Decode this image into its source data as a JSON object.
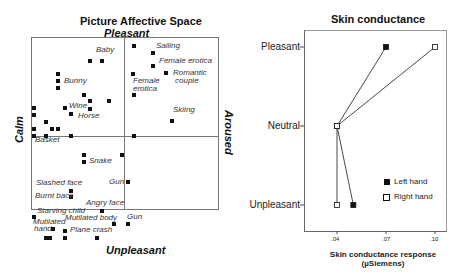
{
  "chart_data": [
    {
      "type": "scatter",
      "title": "Picture Affective Space",
      "axes": {
        "top": "Pleasant",
        "bottom": "Unpleasant",
        "left": "Calm",
        "right": "Aroused"
      },
      "grid": "quadrant lines at center",
      "labels": [
        {
          "text": "Baby",
          "x": 96,
          "y": 50
        },
        {
          "text": "Sailing",
          "x": 156,
          "y": 46
        },
        {
          "text": "Female erotica",
          "x": 159,
          "y": 61
        },
        {
          "text": "Bunny",
          "x": 64,
          "y": 81
        },
        {
          "text": "Romantic",
          "x": 173,
          "y": 73
        },
        {
          "text": "couple",
          "x": 175,
          "y": 81
        },
        {
          "text": "Female",
          "x": 133,
          "y": 81
        },
        {
          "text": "erotica",
          "x": 133,
          "y": 89
        },
        {
          "text": "Wine",
          "x": 69,
          "y": 106
        },
        {
          "text": "Horse",
          "x": 78,
          "y": 116
        },
        {
          "text": "Skiing",
          "x": 173,
          "y": 110
        },
        {
          "text": "Basket",
          "x": 35,
          "y": 140
        },
        {
          "text": "Snake",
          "x": 89,
          "y": 161
        },
        {
          "text": "Gun",
          "x": 109,
          "y": 182
        },
        {
          "text": "Slashed  face",
          "x": 36,
          "y": 183
        },
        {
          "text": "Burnt back",
          "x": 35,
          "y": 196
        },
        {
          "text": "Angry face",
          "x": 86,
          "y": 203
        },
        {
          "text": "Starving child",
          "x": 37,
          "y": 211
        },
        {
          "text": "Mutilated body",
          "x": 65,
          "y": 218
        },
        {
          "text": "Gun",
          "x": 127,
          "y": 217
        },
        {
          "text": "Mutilated",
          "x": 33,
          "y": 222
        },
        {
          "text": "hand",
          "x": 34,
          "y": 229
        },
        {
          "text": "Plane crash",
          "x": 70,
          "y": 230
        }
      ],
      "points": [
        [
          90,
          61
        ],
        [
          102,
          61
        ],
        [
          134,
          46
        ],
        [
          153,
          53
        ],
        [
          153,
          66
        ],
        [
          133,
          74
        ],
        [
          166,
          73
        ],
        [
          134,
          95
        ],
        [
          172,
          121
        ],
        [
          58,
          74
        ],
        [
          58,
          81
        ],
        [
          58,
          88
        ],
        [
          84,
          95
        ],
        [
          90,
          101
        ],
        [
          109,
          101
        ],
        [
          90,
          109
        ],
        [
          65,
          108
        ],
        [
          71,
          114
        ],
        [
          34,
          108
        ],
        [
          34,
          115
        ],
        [
          46,
          122
        ],
        [
          52,
          129
        ],
        [
          58,
          129
        ],
        [
          34,
          129
        ],
        [
          34,
          136
        ],
        [
          46,
          136
        ],
        [
          71,
          136
        ],
        [
          134,
          136
        ],
        [
          84,
          155
        ],
        [
          84,
          162
        ],
        [
          122,
          155
        ],
        [
          128,
          182
        ],
        [
          71,
          191
        ],
        [
          71,
          197
        ],
        [
          102,
          211
        ],
        [
          114,
          224
        ],
        [
          128,
          224
        ],
        [
          34,
          217
        ],
        [
          53,
          229
        ],
        [
          65,
          231
        ],
        [
          46,
          238
        ],
        [
          50,
          238
        ],
        [
          65,
          238
        ],
        [
          97,
          238
        ]
      ]
    },
    {
      "type": "line",
      "title": "Skin conductance",
      "xlabel": "Skin conductance response",
      "xlabel_unit": "(µSiemens)",
      "ylabel": "",
      "categories": [
        "Pleasant",
        "Neutral",
        "Unpleasant"
      ],
      "x_ticks": [
        ".04",
        ".07",
        ".10"
      ],
      "xlim": [
        0.02,
        0.105
      ],
      "orientation": "horizontal",
      "series": [
        {
          "name": "Left hand",
          "marker": "filled-square",
          "values": [
            0.07,
            0.04,
            0.05
          ]
        },
        {
          "name": "Right hand",
          "marker": "open-square",
          "values": [
            0.1,
            0.04,
            0.04
          ]
        }
      ],
      "legend_position": "inside lower right"
    }
  ],
  "left_chart": {
    "title": "Picture Affective Space",
    "top_label": "Pleasant",
    "bottom_label": "Unpleasant",
    "left_label": "Calm",
    "right_label": "Aroused"
  },
  "right_chart": {
    "title": "Skin conductance",
    "rows": [
      "Pleasant",
      "Neutral",
      "Unpleasant"
    ],
    "ticks": [
      ".04",
      ".07",
      ".10"
    ],
    "xlabel_line1": "Skin conductance response",
    "xlabel_line2": "(µSiemens)",
    "legend": [
      {
        "label": "Left hand",
        "marker": "filled-square"
      },
      {
        "label": "Right hand",
        "marker": "open-square"
      }
    ]
  }
}
